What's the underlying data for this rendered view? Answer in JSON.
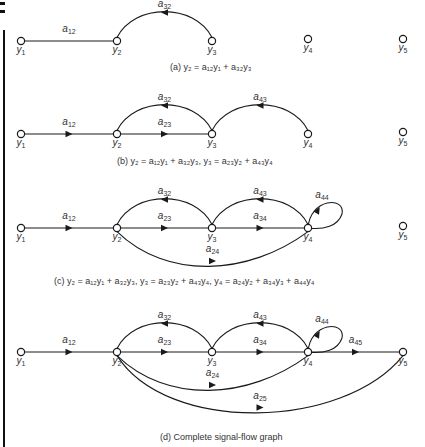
{
  "figure": {
    "panels": [
      {
        "id": "a",
        "caption": "(a)  y₂ = a₁₂y₁ + a₃₂y₃",
        "edges": [
          {
            "from": "y1",
            "to": "y2",
            "label": "a12",
            "arrow": false
          },
          {
            "from": "y3",
            "to": "y2",
            "label": "a32"
          }
        ]
      },
      {
        "id": "b",
        "caption": "(b)  y₂ = a₁₂y₁ + a₃₂y₃,    y₃ = a₂₃y₂ + a₄₃y₄",
        "edges": [
          {
            "from": "y1",
            "to": "y2",
            "label": "a12"
          },
          {
            "from": "y2",
            "to": "y3",
            "label": "a23"
          },
          {
            "from": "y3",
            "to": "y2",
            "label": "a32"
          },
          {
            "from": "y4",
            "to": "y3",
            "label": "a43"
          }
        ]
      },
      {
        "id": "c",
        "caption": "(c)  y₂ = a₁₂y₁ + a₃₂y₃,    y₃ = a₂₃y₂ + a₄₃y₄,    y₄ = a₂₄y₂ + a₃₄y₃ + a₄₄y₄",
        "edges": [
          {
            "from": "y1",
            "to": "y2",
            "label": "a12"
          },
          {
            "from": "y2",
            "to": "y3",
            "label": "a23"
          },
          {
            "from": "y3",
            "to": "y2",
            "label": "a32"
          },
          {
            "from": "y3",
            "to": "y4",
            "label": "a34"
          },
          {
            "from": "y4",
            "to": "y3",
            "label": "a43"
          },
          {
            "from": "y4",
            "to": "y4",
            "label": "a44"
          },
          {
            "from": "y2",
            "to": "y4",
            "label": "a24"
          }
        ]
      },
      {
        "id": "d",
        "caption": "(d)  Complete signal-flow graph",
        "edges": [
          {
            "from": "y1",
            "to": "y2",
            "label": "a12"
          },
          {
            "from": "y2",
            "to": "y3",
            "label": "a23"
          },
          {
            "from": "y3",
            "to": "y2",
            "label": "a32"
          },
          {
            "from": "y3",
            "to": "y4",
            "label": "a34"
          },
          {
            "from": "y4",
            "to": "y3",
            "label": "a43"
          },
          {
            "from": "y4",
            "to": "y4",
            "label": "a44"
          },
          {
            "from": "y2",
            "to": "y4",
            "label": "a24"
          },
          {
            "from": "y4",
            "to": "y5",
            "label": "a45"
          },
          {
            "from": "y2",
            "to": "y5",
            "label": "a25"
          }
        ]
      }
    ],
    "node_labels": {
      "y1": [
        "y",
        "1"
      ],
      "y2": [
        "y",
        "2"
      ],
      "y3": [
        "y",
        "3"
      ],
      "y4": [
        "y",
        "4"
      ],
      "y5": [
        "y",
        "5"
      ]
    },
    "gain_labels": {
      "a12": [
        "a",
        "12"
      ],
      "a23": [
        "a",
        "23"
      ],
      "a32": [
        "a",
        "32"
      ],
      "a34": [
        "a",
        "34"
      ],
      "a43": [
        "a",
        "43"
      ],
      "a44": [
        "a",
        "44"
      ],
      "a24": [
        "a",
        "24"
      ],
      "a45": [
        "a",
        "45"
      ],
      "a25": [
        "a",
        "25"
      ]
    }
  }
}
